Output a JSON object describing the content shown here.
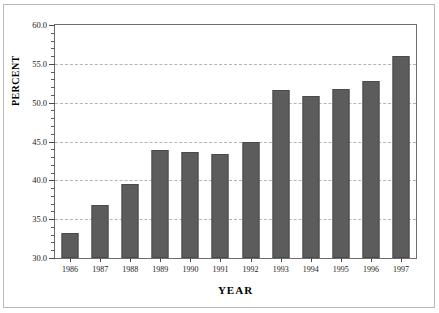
{
  "chart_data": {
    "type": "bar",
    "title": "",
    "xlabel": "YEAR",
    "ylabel": "PERCENT",
    "categories": [
      "1986",
      "1987",
      "1988",
      "1989",
      "1990",
      "1991",
      "1992",
      "1993",
      "1994",
      "1995",
      "1996",
      "1997"
    ],
    "values": [
      33.2,
      36.8,
      39.5,
      43.9,
      43.6,
      43.4,
      45.0,
      51.6,
      50.9,
      51.8,
      52.8,
      56.0
    ],
    "ylim": [
      30.0,
      60.0
    ],
    "y_major_ticks": [
      30.0,
      35.0,
      40.0,
      45.0,
      50.0,
      55.0,
      60.0
    ],
    "y_tick_labels": [
      "30.0",
      "35.0",
      "40.0",
      "45.0",
      "50.0",
      "55.0",
      "60.0"
    ],
    "y_minor_tick_step": 1.0,
    "grid": "horizontal-dashed-major",
    "legend": "none",
    "bar_color": "#5c5c5c",
    "grid_color": "#b5b5b5",
    "axis_color": "#6d6d6d",
    "background_color": "#ffffff"
  }
}
